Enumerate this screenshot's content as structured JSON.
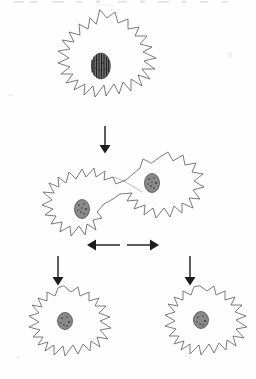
{
  "figure": {
    "background_color": "#fefefe",
    "ink_color": "#5a5a5a",
    "arrow_color": "#1d1d1d",
    "nucleus_color": "#2b2b2b",
    "cropped_top_text": "",
    "stages": [
      {
        "id": "stage-1",
        "label": "Parent amoeba with dividing nucleus",
        "nuclei_count": 1,
        "nucleus_type": "elongated striated chromosome plate",
        "center": {
          "x": 100,
          "y": 66
        },
        "width": 126,
        "height": 112
      },
      {
        "id": "stage-2",
        "label": "Elongated dumbbell-shaped cell with two nuclei",
        "nuclei_count": 2,
        "nucleus_type": "round granular",
        "center": {
          "x": 112,
          "y": 199
        },
        "width": 176,
        "height": 92
      },
      {
        "id": "stage-3-left",
        "label": "Left daughter amoeba",
        "nuclei_count": 1,
        "nucleus_type": "round granular",
        "center": {
          "x": 64,
          "y": 326
        },
        "width": 100,
        "height": 84
      },
      {
        "id": "stage-3-right",
        "label": "Right daughter amoeba",
        "nuclei_count": 1,
        "nucleus_type": "round granular",
        "center": {
          "x": 200,
          "y": 325
        },
        "width": 100,
        "height": 82
      }
    ],
    "arrows": [
      {
        "id": "arrow-down-top",
        "direction": "down",
        "from": {
          "x": 105,
          "y": 126
        },
        "to": {
          "x": 105,
          "y": 152
        }
      },
      {
        "id": "arrow-split-left",
        "direction": "left",
        "from": {
          "x": 120,
          "y": 245
        },
        "to": {
          "x": 88,
          "y": 245
        }
      },
      {
        "id": "arrow-split-right",
        "direction": "right",
        "from": {
          "x": 127,
          "y": 245
        },
        "to": {
          "x": 158,
          "y": 245
        }
      },
      {
        "id": "arrow-down-left",
        "direction": "down",
        "from": {
          "x": 58,
          "y": 256
        },
        "to": {
          "x": 58,
          "y": 285
        }
      },
      {
        "id": "arrow-down-right",
        "direction": "down",
        "from": {
          "x": 190,
          "y": 256
        },
        "to": {
          "x": 190,
          "y": 285
        }
      }
    ]
  }
}
